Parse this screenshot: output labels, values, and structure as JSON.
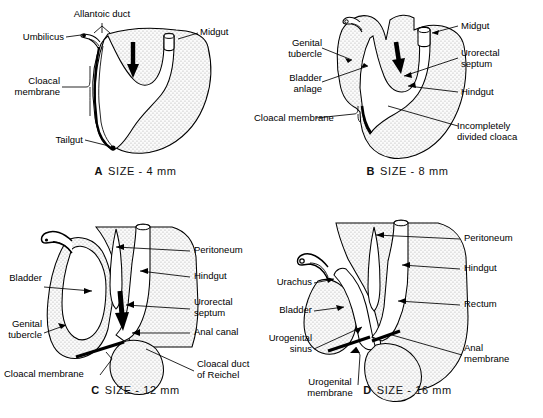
{
  "figure": {
    "type": "anatomical-diagram",
    "stipple_color": "#d9d9d9",
    "line_color": "#000000",
    "background": "#ffffff"
  },
  "panels": [
    {
      "id": "A",
      "caption_letter": "A",
      "caption_text": "SIZE - 4 mm",
      "labels": [
        {
          "name": "allantoic-duct",
          "text": "Allantoic duct"
        },
        {
          "name": "umbilicus",
          "text": "Umbilicus"
        },
        {
          "name": "cloacal-membrane",
          "text": "Cloacal\nmembrane"
        },
        {
          "name": "tailgut",
          "text": "Tailgut"
        },
        {
          "name": "midgut",
          "text": "Midgut"
        }
      ]
    },
    {
      "id": "B",
      "caption_letter": "B",
      "caption_text": "SIZE - 8 mm",
      "labels": [
        {
          "name": "genital-tubercle",
          "text": "Genital\ntubercle"
        },
        {
          "name": "bladder-anlage",
          "text": "Bladder\nanlage"
        },
        {
          "name": "cloacal-membrane",
          "text": "Cloacal membrane"
        },
        {
          "name": "midgut",
          "text": "Midgut"
        },
        {
          "name": "urorectal-septum",
          "text": "Urorectal\nseptum"
        },
        {
          "name": "hindgut",
          "text": "Hindgut"
        },
        {
          "name": "incompletely-divided-cloaca",
          "text": "Incompletely\ndivided cloaca"
        }
      ]
    },
    {
      "id": "C",
      "caption_letter": "C",
      "caption_text": "SIZE - 12 mm",
      "labels": [
        {
          "name": "bladder",
          "text": "Bladder"
        },
        {
          "name": "genital-tubercle",
          "text": "Genital\ntubercle"
        },
        {
          "name": "cloacal-membrane",
          "text": "Cloacal membrane"
        },
        {
          "name": "peritoneum",
          "text": "Peritoneum"
        },
        {
          "name": "hindgut",
          "text": "Hindgut"
        },
        {
          "name": "urorectal-septum",
          "text": "Urorectal\nseptum"
        },
        {
          "name": "anal-canal",
          "text": "Anal canal"
        },
        {
          "name": "cloacal-duct-of-reichel",
          "text": "Cloacal duct\nof Reichel"
        }
      ]
    },
    {
      "id": "D",
      "caption_letter": "D",
      "caption_text": "SIZE - 16 mm",
      "labels": [
        {
          "name": "urachus",
          "text": "Urachus"
        },
        {
          "name": "bladder",
          "text": "Bladder"
        },
        {
          "name": "urogenital-sinus",
          "text": "Urogenital\nsinus"
        },
        {
          "name": "urogenital-membrane",
          "text": "Urogenital\nmembrane"
        },
        {
          "name": "peritoneum",
          "text": "Peritoneum"
        },
        {
          "name": "hindgut",
          "text": "Hindgut"
        },
        {
          "name": "rectum",
          "text": "Rectum"
        },
        {
          "name": "anal-membrane",
          "text": "Anal\nmembrane"
        }
      ]
    }
  ]
}
